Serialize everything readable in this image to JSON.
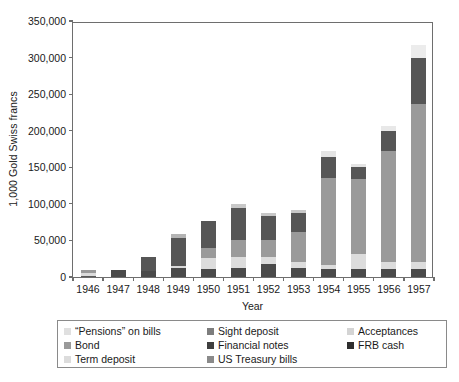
{
  "chart_data": {
    "type": "bar",
    "stacked": true,
    "title": "",
    "xlabel": "Year",
    "ylabel": "1,000 Gold Swiss francs",
    "categories": [
      "1946",
      "1947",
      "1948",
      "1949",
      "1950",
      "1951",
      "1952",
      "1953",
      "1954",
      "1955",
      "1956",
      "1957"
    ],
    "ylim": [
      0,
      350000
    ],
    "yticks": [
      0,
      50000,
      100000,
      150000,
      200000,
      250000,
      300000,
      350000
    ],
    "ytick_labels": [
      "0",
      "50,000",
      "100,000",
      "150,000",
      "200,000",
      "250,000",
      "300,000",
      "350,000"
    ],
    "grid": false,
    "legend_position": "below",
    "series": [
      {
        "name": "“Pensions” on bills",
        "color": "#e8e8e8",
        "values": [
          8000,
          0,
          0,
          0,
          0,
          0,
          0,
          0,
          0,
          0,
          0,
          0
        ]
      },
      {
        "name": "Bond",
        "color": "#9a9a9a",
        "values": [
          0,
          0,
          0,
          1500,
          2000,
          2500,
          2500,
          2500,
          2500,
          2500,
          2500,
          2500
        ]
      },
      {
        "name": "Term deposit",
        "color": "#d6d6d6",
        "values": [
          0,
          0,
          0,
          0,
          0,
          0,
          0,
          0,
          0,
          0,
          0,
          0
        ]
      },
      {
        "name": "Sight deposit",
        "color": "#808080",
        "values": [
          0,
          0,
          0,
          0,
          0,
          0,
          0,
          0,
          0,
          0,
          0,
          0
        ]
      },
      {
        "name": "Financial notes",
        "color": "#4a4a4a",
        "values": [
          0,
          7500,
          7000,
          12000,
          10000,
          14000,
          18000,
          13000,
          11000,
          11000,
          11000,
          11000
        ]
      },
      {
        "name": "US Treasury bills",
        "color": "#8c8c8c",
        "values": [
          0,
          0,
          0,
          0,
          0,
          0,
          0,
          0,
          0,
          0,
          0,
          0
        ]
      },
      {
        "name": "Acceptances",
        "color": "#d0d0d0",
        "values": [
          0,
          0,
          0,
          0,
          0,
          0,
          0,
          0,
          0,
          0,
          0,
          0
        ]
      },
      {
        "name": "FRB cash",
        "color": "#3a3a3a",
        "values": [
          0,
          0,
          0,
          0,
          0,
          0,
          0,
          0,
          0,
          0,
          0,
          0
        ]
      }
    ],
    "bars": [
      {
        "category": "1946",
        "total": 9000,
        "segments": [
          {
            "series": "Financial notes",
            "value": 2000,
            "color": "#5a5a5a"
          },
          {
            "series": "“Pensions” on bills",
            "value": 4000,
            "color": "#dcdcdc"
          },
          {
            "series": "Bond",
            "value": 3000,
            "color": "#9a9a9a"
          }
        ]
      },
      {
        "category": "1947",
        "total": 9000,
        "segments": [
          {
            "series": "Financial notes",
            "value": 9000,
            "color": "#4a4a4a"
          }
        ]
      },
      {
        "category": "1948",
        "total": 27000,
        "segments": [
          {
            "series": "Financial notes",
            "value": 8000,
            "color": "#4a4a4a"
          },
          {
            "series": "Sight deposit",
            "value": 19000,
            "color": "#565656"
          }
        ]
      },
      {
        "category": "1949",
        "total": 59000,
        "segments": [
          {
            "series": "Financial notes",
            "value": 12000,
            "color": "#4a4a4a"
          },
          {
            "series": "Term deposit",
            "value": 3000,
            "color": "#dadada"
          },
          {
            "series": "Sight deposit",
            "value": 38000,
            "color": "#565656"
          },
          {
            "series": "Acceptances",
            "value": 6000,
            "color": "#b4b4b4"
          }
        ]
      },
      {
        "category": "1950",
        "total": 76000,
        "segments": [
          {
            "series": "Financial notes",
            "value": 11000,
            "color": "#4a4a4a"
          },
          {
            "series": "Term deposit",
            "value": 15000,
            "color": "#dcdcdc"
          },
          {
            "series": "Bond",
            "value": 14000,
            "color": "#9a9a9a"
          },
          {
            "series": "Sight deposit",
            "value": 36000,
            "color": "#565656"
          }
        ]
      },
      {
        "category": "1951",
        "total": 100000,
        "segments": [
          {
            "series": "Financial notes",
            "value": 13000,
            "color": "#4a4a4a"
          },
          {
            "series": "Term deposit",
            "value": 14000,
            "color": "#dcdcdc"
          },
          {
            "series": "Bond",
            "value": 23000,
            "color": "#9a9a9a"
          },
          {
            "series": "Sight deposit",
            "value": 44000,
            "color": "#565656"
          },
          {
            "series": "Acceptances",
            "value": 6000,
            "color": "#c8c8c8"
          }
        ]
      },
      {
        "category": "1952",
        "total": 87000,
        "segments": [
          {
            "series": "Financial notes",
            "value": 18000,
            "color": "#4a4a4a"
          },
          {
            "series": "Term deposit",
            "value": 10000,
            "color": "#dcdcdc"
          },
          {
            "series": "Bond",
            "value": 22000,
            "color": "#9a9a9a"
          },
          {
            "series": "Sight deposit",
            "value": 33000,
            "color": "#565656"
          },
          {
            "series": "Acceptances",
            "value": 4000,
            "color": "#c8c8c8"
          }
        ]
      },
      {
        "category": "1953",
        "total": 92000,
        "segments": [
          {
            "series": "Financial notes",
            "value": 13000,
            "color": "#4a4a4a"
          },
          {
            "series": "Term deposit",
            "value": 8000,
            "color": "#dcdcdc"
          },
          {
            "series": "Bond",
            "value": 41000,
            "color": "#9a9a9a"
          },
          {
            "series": "Sight deposit",
            "value": 26000,
            "color": "#565656"
          },
          {
            "series": "Acceptances",
            "value": 4000,
            "color": "#c8c8c8"
          }
        ]
      },
      {
        "category": "1954",
        "total": 172000,
        "segments": [
          {
            "series": "Financial notes",
            "value": 11000,
            "color": "#4a4a4a"
          },
          {
            "series": "Term deposit",
            "value": 6000,
            "color": "#dcdcdc"
          },
          {
            "series": "Bond",
            "value": 118000,
            "color": "#9a9a9a"
          },
          {
            "series": "Sight deposit",
            "value": 29000,
            "color": "#565656"
          },
          {
            "series": "Acceptances",
            "value": 8000,
            "color": "#e4e4e4"
          }
        ]
      },
      {
        "category": "1955",
        "total": 155000,
        "segments": [
          {
            "series": "Financial notes",
            "value": 11000,
            "color": "#4a4a4a"
          },
          {
            "series": "Term deposit",
            "value": 20000,
            "color": "#dcdcdc"
          },
          {
            "series": "Bond",
            "value": 103000,
            "color": "#9a9a9a"
          },
          {
            "series": "Sight deposit",
            "value": 16000,
            "color": "#565656"
          },
          {
            "series": "Acceptances",
            "value": 5000,
            "color": "#e4e4e4"
          }
        ]
      },
      {
        "category": "1956",
        "total": 206000,
        "segments": [
          {
            "series": "Financial notes",
            "value": 11000,
            "color": "#4a4a4a"
          },
          {
            "series": "Term deposit",
            "value": 9000,
            "color": "#dcdcdc"
          },
          {
            "series": "Bond",
            "value": 152000,
            "color": "#9a9a9a"
          },
          {
            "series": "Sight deposit",
            "value": 28000,
            "color": "#565656"
          },
          {
            "series": "Acceptances",
            "value": 6000,
            "color": "#e8e8e8"
          }
        ]
      },
      {
        "category": "1957",
        "total": 317000,
        "segments": [
          {
            "series": "Financial notes",
            "value": 11000,
            "color": "#4a4a4a"
          },
          {
            "series": "Term deposit",
            "value": 9000,
            "color": "#dcdcdc"
          },
          {
            "series": "Bond",
            "value": 216000,
            "color": "#9a9a9a"
          },
          {
            "series": "Sight deposit",
            "value": 64000,
            "color": "#565656"
          },
          {
            "series": "Acceptances",
            "value": 17000,
            "color": "#ececec"
          }
        ]
      }
    ],
    "legend": {
      "entries": [
        {
          "label": "“Pensions” on bills",
          "color": "#e0e0e0"
        },
        {
          "label": "Sight deposit",
          "color": "#7d7d7d"
        },
        {
          "label": "Acceptances",
          "color": "#d4d4d4"
        },
        {
          "label": "Bond",
          "color": "#9a9a9a"
        },
        {
          "label": "Financial notes",
          "color": "#3f3f3f"
        },
        {
          "label": "FRB cash",
          "color": "#2e2e2e"
        },
        {
          "label": "Term deposit",
          "color": "#dcdcdc"
        },
        {
          "label": "US Treasury bills",
          "color": "#8a8a8a"
        }
      ]
    },
    "colors": {
      "axis": "#6e6e6e",
      "text": "#1a1a1a",
      "background": "#ffffff",
      "legend_border": "#8a8a8a"
    }
  }
}
